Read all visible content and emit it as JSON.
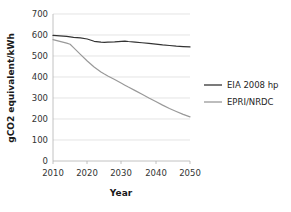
{
  "chart_data": {
    "type": "line",
    "title": "",
    "xlabel": "Year",
    "ylabel": "gCO2 equivalent/kWh",
    "xlim": [
      2010,
      2050
    ],
    "ylim": [
      0,
      700
    ],
    "xticks": [
      2010,
      2020,
      2030,
      2040,
      2050
    ],
    "yticks": [
      0,
      100,
      200,
      300,
      400,
      500,
      600,
      700
    ],
    "grid": "horizontal",
    "legend_position": "right",
    "x": [
      2010,
      2012,
      2014,
      2015,
      2016,
      2018,
      2020,
      2022,
      2024,
      2025,
      2026,
      2028,
      2030,
      2031,
      2032,
      2034,
      2036,
      2038,
      2040,
      2042,
      2044,
      2046,
      2048,
      2050
    ],
    "series": [
      {
        "name": "EIA 2008 hp",
        "color": "#333333",
        "values": [
          598,
          596,
          593,
          591,
          589,
          586,
          581,
          570,
          566,
          565,
          566,
          567,
          570,
          571,
          569,
          566,
          563,
          560,
          557,
          553,
          550,
          547,
          545,
          543
        ]
      },
      {
        "name": "EPRI/NRDC",
        "color": "#999999",
        "values": [
          578,
          570,
          561,
          556,
          540,
          508,
          476,
          448,
          424,
          414,
          405,
          388,
          370,
          361,
          352,
          335,
          318,
          300,
          283,
          266,
          250,
          236,
          222,
          210
        ]
      }
    ]
  },
  "legend": {
    "items": [
      {
        "label": "EIA 2008 hp",
        "color": "#333333"
      },
      {
        "label": "EPRI/NRDC",
        "color": "#999999"
      }
    ]
  },
  "axes": {
    "y_tick_labels": [
      "700",
      "600",
      "500",
      "400",
      "300",
      "200",
      "100",
      "0"
    ],
    "x_tick_labels": [
      "2010",
      "2020",
      "2030",
      "2040",
      "2050"
    ],
    "y_axis_title": "gCO2 equivalent/kWh",
    "x_axis_title": "Year"
  },
  "colors": {
    "background": "#ffffff",
    "grid": "#d9d9d9",
    "axis": "#b3b3b3",
    "text": "#2b2b2b",
    "series_primary": "#333333",
    "series_secondary": "#999999"
  }
}
